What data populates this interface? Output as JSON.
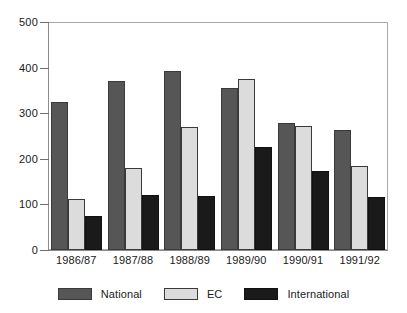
{
  "chart_data": {
    "type": "bar",
    "title": "",
    "subtitle": "",
    "xlabel": "",
    "ylabel": "",
    "ylim": [
      0,
      500
    ],
    "yticks": [
      0,
      100,
      200,
      300,
      400,
      500
    ],
    "ytick_labels": [
      "0",
      "100",
      "200",
      "300",
      "400",
      "500"
    ],
    "grid": false,
    "legend_position": "bottom",
    "categories": [
      "1986/87",
      "1987/88",
      "1988/89",
      "1989/90",
      "1990/91",
      "1991/92"
    ],
    "series": [
      {
        "name": "National",
        "color": "#565656",
        "values": [
          324,
          370,
          392,
          355,
          278,
          263
        ]
      },
      {
        "name": "EC",
        "color": "#dcdcdc",
        "values": [
          111,
          180,
          270,
          374,
          273,
          184
        ]
      },
      {
        "name": "International",
        "color": "#1a1a1a",
        "values": [
          75,
          121,
          118,
          227,
          173,
          117
        ]
      }
    ]
  },
  "axes": {
    "frame_color": "#a8a8a8",
    "tick_color": "#6f6f6f",
    "text_color": "#1a1a1a"
  },
  "legend": {
    "entries": [
      {
        "label": "National",
        "swatch": "national-swatch"
      },
      {
        "label": "EC",
        "swatch": "ec-swatch"
      },
      {
        "label": "International",
        "swatch": "international-swatch"
      }
    ]
  }
}
